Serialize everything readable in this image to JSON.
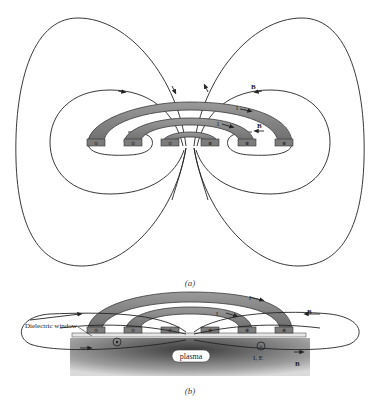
{
  "figure_a": {
    "caption": "(a)",
    "labels": {
      "b_upper": "B",
      "b_lower": "B",
      "i_outer": "I",
      "i_inner": "I"
    },
    "coil_marks": [
      "⊙",
      "⊙",
      "⊙",
      "⊗",
      "⊗",
      "⊗"
    ]
  },
  "figure_b": {
    "caption": "(b)",
    "labels": {
      "dielectric_window": "Dielectric window",
      "plasma": "plasma",
      "b_upper": "B",
      "b_lower": "B",
      "i_outer": "I",
      "i_inner": "I",
      "induced": "I, E"
    },
    "coil_marks": [
      "⊙",
      "⊙",
      "⊙",
      "⊗",
      "⊗",
      "⊗"
    ],
    "current_dot": "•",
    "current_cross": "×"
  },
  "colors": {
    "coil_top": "#8a8a8a",
    "coil_edge": "#3a3a3a",
    "coil_block": "#7c7c7c",
    "field_line": "#222222",
    "plasma_dark": "#555555",
    "plasma_light": "#d8d8d8",
    "window": "#e6e6e6"
  }
}
